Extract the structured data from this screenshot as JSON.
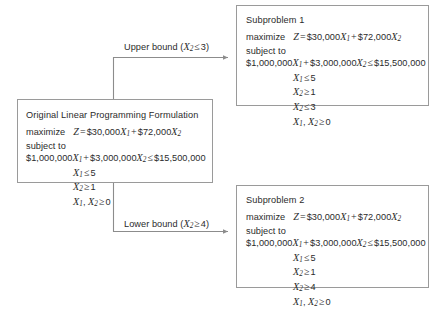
{
  "diagram": {
    "type": "branch-and-bound-tree",
    "line_color": "#8c8c8c",
    "border_color": "#9a9a9a",
    "text_color": "#2b2b2b"
  },
  "original": {
    "title": "Original Linear Programming Formulation",
    "objective_keyword": "maximize",
    "objective_var": "Z",
    "objective_eq": "=",
    "objective_terms": "$30,000X₁ + $72,000X₂",
    "subject_to": "subject to",
    "constraints": [
      "$1,000,000X₁ + $3,000,000X₂ ≤ $15,500,000",
      "X₁ ≤ 5",
      "X₂ ≥ 1",
      "X₁, X₂ ≥ 0"
    ],
    "coef_x1": "$30,000",
    "coef_x2": "$72,000",
    "budget_coef_x1": "$1,000,000",
    "budget_coef_x2": "$3,000,000",
    "budget_rhs": "$15,500,000",
    "c1_rhs": "5",
    "c2_rhs": "1",
    "c3_rhs": "0"
  },
  "branches": {
    "upper": {
      "label": "Upper bound (X₂ ≤ 3)",
      "label_text": "Upper bound (",
      "label_var": "X",
      "label_sub": "2",
      "label_op": "≤",
      "label_value": "3)"
    },
    "lower": {
      "label": "Lower bound (X₂ ≥ 4)",
      "label_text": "Lower bound (",
      "label_var": "X",
      "label_sub": "2",
      "label_op": "≥",
      "label_value": "4)"
    }
  },
  "subproblem1": {
    "title": "Subproblem 1",
    "objective_keyword": "maximize",
    "objective_var": "Z",
    "objective_eq": "=",
    "subject_to": "subject to",
    "coef_x1": "$30,000",
    "coef_x2": "$72,000",
    "budget_coef_x1": "$1,000,000",
    "budget_coef_x2": "$3,000,000",
    "budget_rhs": "$15,500,000",
    "c1_rhs": "5",
    "c2_rhs": "1",
    "branch_op": "≤",
    "branch_rhs": "3",
    "c4_rhs": "0",
    "constraints": [
      "$1,000,000X₁ + $3,000,000X₂ ≤ $15,500,000",
      "X₁ ≤ 5",
      "X₂ ≥ 1",
      "X₂ ≤ 3",
      "X₁, X₂ ≥ 0"
    ]
  },
  "subproblem2": {
    "title": "Subproblem 2",
    "objective_keyword": "maximize",
    "objective_var": "Z",
    "objective_eq": "=",
    "subject_to": "subject to",
    "coef_x1": "$30,000",
    "coef_x2": "$72,000",
    "budget_coef_x1": "$1,000,000",
    "budget_coef_x2": "$3,000,000",
    "budget_rhs": "$15,500,000",
    "c1_rhs": "5",
    "c2_rhs": "1",
    "branch_op": "≥",
    "branch_rhs": "4",
    "c4_rhs": "0",
    "constraints": [
      "$1,000,000X₁ + $3,000,000X₂ ≤ $15,500,000",
      "X₁ ≤ 5",
      "X₂ ≥ 1",
      "X₂ ≥ 4",
      "X₁, X₂ ≥ 0"
    ]
  },
  "symbols": {
    "le": "≤",
    "ge": "≥",
    "plus": "+",
    "eq": "=",
    "comma": ","
  }
}
